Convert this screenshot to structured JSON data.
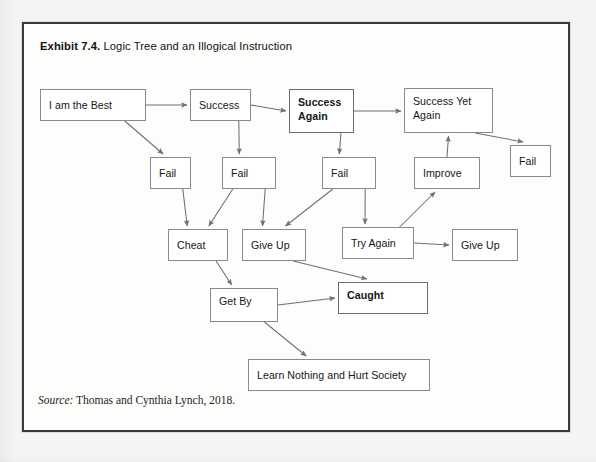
{
  "exhibit": {
    "title_lead": "Exhibit 7.4.",
    "title_rest": " Logic Tree and an Illogical Instruction",
    "source_label": "Source:",
    "source_text": " Thomas and Cynthia Lynch, 2018."
  },
  "diagram": {
    "type": "flowchart",
    "nodes": [
      {
        "id": "i-am-the-best",
        "label": "I am the Best",
        "x": 16,
        "y": 65,
        "w": 106,
        "h": 32,
        "bold": false,
        "lines": 1
      },
      {
        "id": "success",
        "label": "Success",
        "x": 166,
        "y": 65,
        "w": 61,
        "h": 32,
        "bold": false,
        "lines": 1
      },
      {
        "id": "success-again",
        "label": "Success\nAgain",
        "x": 265,
        "y": 65,
        "w": 65,
        "h": 44,
        "bold": true,
        "lines": 2
      },
      {
        "id": "success-yet-again",
        "label": "Success Yet\nAgain",
        "x": 380,
        "y": 64,
        "w": 89,
        "h": 45,
        "bold": false,
        "lines": 2
      },
      {
        "id": "fail-1",
        "label": "Fail",
        "x": 126,
        "y": 133,
        "w": 41,
        "h": 32,
        "bold": false,
        "lines": 1
      },
      {
        "id": "fail-2",
        "label": "Fail",
        "x": 198,
        "y": 133,
        "w": 54,
        "h": 32,
        "bold": false,
        "lines": 1
      },
      {
        "id": "fail-3",
        "label": "Fail",
        "x": 298,
        "y": 133,
        "w": 54,
        "h": 32,
        "bold": false,
        "lines": 1
      },
      {
        "id": "improve",
        "label": "Improve",
        "x": 390,
        "y": 133,
        "w": 66,
        "h": 32,
        "bold": false,
        "lines": 1
      },
      {
        "id": "fail-4",
        "label": "Fail",
        "x": 486,
        "y": 121,
        "w": 41,
        "h": 32,
        "bold": false,
        "lines": 1
      },
      {
        "id": "cheat",
        "label": "Cheat",
        "x": 144,
        "y": 205,
        "w": 60,
        "h": 32,
        "bold": false,
        "lines": 1
      },
      {
        "id": "give-up-1",
        "label": "Give Up",
        "x": 218,
        "y": 205,
        "w": 64,
        "h": 32,
        "bold": false,
        "lines": 1
      },
      {
        "id": "try-again",
        "label": "Try Again",
        "x": 318,
        "y": 203,
        "w": 72,
        "h": 32,
        "bold": false,
        "lines": 1
      },
      {
        "id": "give-up-2",
        "label": "Give Up",
        "x": 428,
        "y": 205,
        "w": 66,
        "h": 32,
        "bold": false,
        "lines": 1
      },
      {
        "id": "get-by",
        "label": "Get By",
        "x": 186,
        "y": 264,
        "w": 68,
        "h": 34,
        "bold": false,
        "lines": 1
      },
      {
        "id": "caught",
        "label": "Caught",
        "x": 314,
        "y": 258,
        "w": 90,
        "h": 32,
        "bold": true,
        "lines": 1
      },
      {
        "id": "learn-nothing",
        "label": "Learn Nothing and Hurt Society",
        "x": 224,
        "y": 335,
        "w": 182,
        "h": 32,
        "bold": false,
        "lines": 1
      }
    ],
    "edges": [
      {
        "from": "i-am-the-best",
        "to": "success",
        "kind": "horizontal"
      },
      {
        "from": "success",
        "to": "success-again",
        "kind": "horizontal"
      },
      {
        "from": "success-again",
        "to": "success-yet-again",
        "kind": "horizontal"
      },
      {
        "from": "i-am-the-best",
        "to": "fail-1",
        "kind": "diagonal"
      },
      {
        "from": "success",
        "to": "fail-2",
        "kind": "diagonal"
      },
      {
        "from": "success-again",
        "to": "fail-3",
        "kind": "diagonal"
      },
      {
        "from": "success-yet-again",
        "to": "fail-4",
        "kind": "diagonal"
      },
      {
        "from": "fail-1",
        "to": "cheat",
        "kind": "diagonal"
      },
      {
        "from": "fail-2",
        "to": "cheat",
        "kind": "diagonal"
      },
      {
        "from": "fail-2",
        "to": "give-up-1",
        "kind": "diagonal"
      },
      {
        "from": "fail-3",
        "to": "give-up-1",
        "kind": "diagonal"
      },
      {
        "from": "fail-3",
        "to": "try-again",
        "kind": "diagonal"
      },
      {
        "from": "try-again",
        "to": "improve",
        "kind": "diagonal"
      },
      {
        "from": "improve",
        "to": "success-yet-again",
        "kind": "vertical"
      },
      {
        "from": "try-again",
        "to": "give-up-2",
        "kind": "horizontal"
      },
      {
        "from": "cheat",
        "to": "get-by",
        "kind": "diagonal"
      },
      {
        "from": "give-up-1",
        "to": "caught",
        "kind": "diagonal"
      },
      {
        "from": "get-by",
        "to": "caught",
        "kind": "horizontal"
      },
      {
        "from": "get-by",
        "to": "learn-nothing",
        "kind": "diagonal"
      }
    ]
  },
  "colors": {
    "box_border": "#8a8a8a",
    "arrow": "#6f6f6f",
    "frame": "#3a3a3a",
    "text": "#161616"
  }
}
